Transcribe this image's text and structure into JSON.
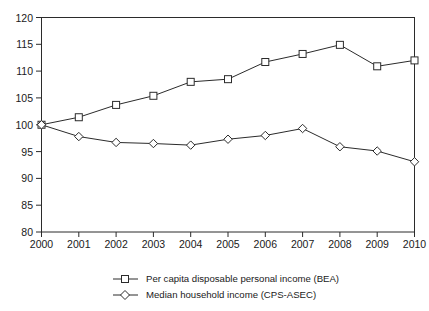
{
  "chart_data": {
    "type": "line",
    "title": "",
    "subtitle": "",
    "xlabel": "",
    "ylabel": "",
    "x": [
      2000,
      2001,
      2002,
      2003,
      2004,
      2005,
      2006,
      2007,
      2008,
      2009,
      2010
    ],
    "categories": [
      "2000",
      "2001",
      "2002",
      "2003",
      "2004",
      "2005",
      "2006",
      "2007",
      "2008",
      "2009",
      "2010"
    ],
    "series": [
      {
        "name": "Per capita disposable personal income (BEA)",
        "marker": "square",
        "color": "#2b2b2b",
        "values": [
          100.0,
          101.4,
          103.7,
          105.4,
          108.0,
          108.5,
          111.7,
          113.2,
          114.9,
          110.9,
          112.0
        ]
      },
      {
        "name": "Median household income (CPS-ASEC)",
        "marker": "diamond",
        "color": "#2b2b2b",
        "values": [
          100.0,
          97.8,
          96.7,
          96.5,
          96.2,
          97.3,
          98.0,
          99.3,
          95.9,
          95.1,
          93.1
        ]
      }
    ],
    "ylim": [
      80,
      120
    ],
    "xlim": [
      2000,
      2010
    ],
    "ytick_labels": [
      "80",
      "85",
      "90",
      "95",
      "100",
      "105",
      "110",
      "115",
      "120"
    ],
    "ytick_values": [
      80,
      85,
      90,
      95,
      100,
      105,
      110,
      115,
      120
    ],
    "xtick_labels": [
      "2000",
      "2001",
      "2002",
      "2003",
      "2004",
      "2005",
      "2006",
      "2007",
      "2008",
      "2009",
      "2010"
    ],
    "grid": false,
    "legend_position": "bottom-center",
    "legend": [
      "Per capita disposable personal income (BEA)",
      "Median household income (CPS-ASEC)"
    ]
  },
  "legend": {
    "items": [
      {
        "label": "Per capita disposable personal income (BEA)",
        "marker": "square-marker-icon"
      },
      {
        "label": "Median household income (CPS-ASEC)",
        "marker": "diamond-marker-icon"
      }
    ]
  },
  "axes": {
    "y_ticks": [
      "120",
      "115",
      "110",
      "105",
      "100",
      "95",
      "90",
      "85",
      "80"
    ],
    "x_ticks": [
      "2000",
      "2001",
      "2002",
      "2003",
      "2004",
      "2005",
      "2006",
      "2007",
      "2008",
      "2009",
      "2010"
    ]
  }
}
